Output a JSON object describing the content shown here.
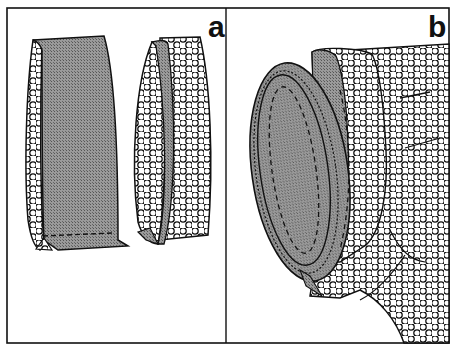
{
  "figure": {
    "panels": [
      {
        "id": "a",
        "label": "a",
        "description": "Two cylindrical fabric tubes: left tube shows grey textured inner lining folded over polka-dot outer fabric with dashed stitching line at bottom; right tube shows lining inserted inside polka-dot sleeve"
      },
      {
        "id": "b",
        "label": "b",
        "description": "Lined sleeve/cuff attached to a polka-dot garment body, grey lining visible through oval opening with dashed stitching lines"
      }
    ],
    "colors": {
      "outline": "#111111",
      "lining_fill": "#8a8a8a",
      "fabric_fill": "#ffffff",
      "dot_stroke": "#111111",
      "background": "#ffffff"
    }
  }
}
